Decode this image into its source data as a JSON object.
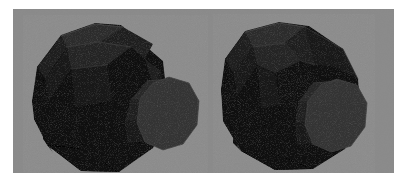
{
  "figure": {
    "title": "Two shaded stepped decagonal prisms",
    "background_color": "#8a8a8a",
    "page_color": "#ffffff",
    "plate": {
      "x": 13,
      "y": 9,
      "width": 381,
      "height": 164
    },
    "render_style": "flat-shaded faceted polyhedra",
    "object_count": 2
  },
  "palette": {
    "background": "#8a8a8a",
    "page": "#ffffff",
    "body_dark": "#141414",
    "body_darkest": "#070707",
    "body_mid": "#1d1d1d",
    "body_top": "#262626",
    "body_top_light": "#2b2b2b",
    "collar_shadow": "#0a0a0a",
    "end_cap": "#333333",
    "end_cap_dim": "#2c2c2c",
    "edge_highlight": "#4a4a4a",
    "edge_faint": "#3a3a3a"
  },
  "objects": [
    {
      "name": "left-polyhedron",
      "label": "Left stepped decagonal prism",
      "hub_facet_count": 10,
      "shaft_facet_count": 10,
      "end_cap_shape": "decagon",
      "end_cap_color": "#333333",
      "orientation_note": "viewed from upper-left, shaft pointing lower-right",
      "silhouette": "19,92 24,58 48,26 82,14 108,16 150,52 155,96 140,139 106,163 68,162 34,136 21,110",
      "hub": {
        "top_facets": [
          {
            "name": "hub-top-far",
            "points": "48,27 82,15 110,18 86,33 54,38",
            "fill": "#2b2b2b"
          },
          {
            "name": "hub-top-near",
            "points": "54,38 86,33 118,38 94,56 58,60",
            "fill": "#242424"
          },
          {
            "name": "hub-top-right",
            "points": "86,33 110,18 140,35 132,50 118,38",
            "fill": "#1f1f1f"
          }
        ],
        "side_facets": [
          {
            "name": "hub-side-upper-left",
            "points": "24,58 48,27 54,38 32,70",
            "fill": "#1a1a1a"
          },
          {
            "name": "hub-side-left",
            "points": "32,70 54,38 58,60 36,92",
            "fill": "#141414"
          },
          {
            "name": "hub-side-lower-left",
            "points": "19,92 32,70 36,92 24,116",
            "fill": "#101010"
          },
          {
            "name": "hub-front-upper",
            "points": "58,60 94,56 100,92 62,98",
            "fill": "#131313"
          },
          {
            "name": "hub-front-lower",
            "points": "36,92 62,98 70,140 30,130",
            "fill": "#0c0c0c"
          },
          {
            "name": "hub-bottom-left",
            "points": "21,110 36,92 30,130 40,144",
            "fill": "#090909"
          },
          {
            "name": "hub-bottom",
            "points": "34,136 70,140 106,163 68,162",
            "fill": "#070707"
          },
          {
            "name": "hub-bottom-right",
            "points": "70,140 100,92 140,110 106,163",
            "fill": "#0a0a0a"
          }
        ],
        "right_facets": [
          {
            "name": "hub-collar-right-upper",
            "points": "118,38 132,50 148,62 140,76 128,56",
            "fill": "#1c1c1c"
          },
          {
            "name": "hub-collar-right",
            "points": "140,76 148,62 155,96 143,120",
            "fill": "#161616"
          },
          {
            "name": "hub-collar-right-lower",
            "points": "143,120 155,96 140,139 120,150",
            "fill": "#101010"
          }
        ]
      },
      "collar": {
        "name": "hub-collar-band",
        "description": "recessed dark band between hub and shaft",
        "points": "94,56 118,38 132,50 140,76 136,112 118,140 100,150 86,124 100,92",
        "fill": "#0a0a0a"
      },
      "shaft": {
        "facets": [
          {
            "name": "shaft-top-far",
            "points": "118,90 134,72 158,70 146,88",
            "fill": "#262626"
          },
          {
            "name": "shaft-top-near",
            "points": "112,112 118,90 146,88 142,110",
            "fill": "#1e1e1e"
          },
          {
            "name": "shaft-side",
            "points": "112,112 142,110 140,132 114,134",
            "fill": "#161616"
          }
        ]
      },
      "end_cap": {
        "name": "left-end-cap",
        "points": "156,68 176,74 186,92 184,116 170,135 150,141 132,133 124,114 127,90 140,74",
        "fill": "#333333",
        "stroke": "#3e3e3e"
      }
    },
    {
      "name": "right-polyhedron",
      "label": "Right stepped decagonal prism",
      "hub_facet_count": 10,
      "shaft_facet_count": 10,
      "end_cap_shape": "decagon",
      "end_cap_color": "#333333",
      "orientation_note": "viewed from upper-left, rotated; upper-right chamfer exposed",
      "silhouette": "208,80 212,50 232,22 266,13 296,17 330,40 345,70 348,104 332,140 300,160 262,161 228,142 210,112",
      "hub": {
        "top_facets": [
          {
            "name": "r-hub-top-far",
            "points": "232,23 266,14 292,18 272,34 240,38",
            "fill": "#2b2b2b"
          },
          {
            "name": "r-hub-top-near",
            "points": "240,38 272,34 288,52 262,64 244,56",
            "fill": "#232323"
          },
          {
            "name": "r-hub-chamfer-right",
            "points": "272,34 292,18 330,40 302,56 288,52",
            "fill": "#1d1d1d"
          },
          {
            "name": "r-hub-chamfer-far",
            "points": "292,18 330,40 345,70 322,58 302,56",
            "fill": "#151515"
          }
        ],
        "side_facets": [
          {
            "name": "r-hub-side-upper-left",
            "points": "212,50 232,23 240,38 220,64",
            "fill": "#1b1b1b"
          },
          {
            "name": "r-hub-side-left",
            "points": "220,64 240,38 244,56 224,88",
            "fill": "#151515"
          },
          {
            "name": "r-hub-side-lower-left",
            "points": "208,80 220,64 224,88 212,112",
            "fill": "#101010"
          },
          {
            "name": "r-hub-front-upper",
            "points": "244,56 262,64 268,96 248,100",
            "fill": "#121212"
          },
          {
            "name": "r-hub-front-lower",
            "points": "224,88 248,100 256,142 220,134",
            "fill": "#0c0c0c"
          },
          {
            "name": "r-hub-bottom-left",
            "points": "210,112 224,88 220,134 228,142",
            "fill": "#090909"
          },
          {
            "name": "r-hub-bottom",
            "points": "228,142 256,142 300,160 262,161",
            "fill": "#070707"
          },
          {
            "name": "r-hub-bottom-right",
            "points": "256,142 268,96 312,114 300,160",
            "fill": "#0a0a0a"
          },
          {
            "name": "r-hub-right",
            "points": "288,52 302,56 322,58 330,92 312,114 268,96 262,64",
            "fill": "#111111"
          }
        ]
      },
      "collar": {
        "name": "r-hub-collar-band",
        "description": "recessed dark band along upper-right chamfer",
        "points": "288,52 302,56 322,58 345,70 340,86 316,74 300,66 288,60",
        "fill": "#0b0b0b"
      },
      "shaft": {
        "facets": [
          {
            "name": "r-shaft-top-far",
            "points": "286,92 300,74 326,72 314,90",
            "fill": "#272727"
          },
          {
            "name": "r-shaft-top-near",
            "points": "282,114 286,92 314,90 310,112",
            "fill": "#1f1f1f"
          },
          {
            "name": "r-shaft-side",
            "points": "282,114 310,112 308,134 284,136",
            "fill": "#171717"
          }
        ]
      },
      "end_cap": {
        "name": "right-end-cap",
        "points": "324,70 344,76 354,94 352,118 338,137 318,143 300,135 292,116 295,92 308,76",
        "fill": "#333333",
        "stroke": "#3e3e3e"
      }
    }
  ],
  "edge_highlights": [
    {
      "name": "left-hub-top-edge-1",
      "points": "48,27 82,15 110,18",
      "stroke": "#4f4f4f",
      "width": 0.9
    },
    {
      "name": "left-hub-top-edge-2",
      "points": "54,38 86,33 118,38",
      "stroke": "#454545",
      "width": 0.8
    },
    {
      "name": "left-hub-top-edge-3",
      "points": "58,60 94,56",
      "stroke": "#3c3c3c",
      "width": 0.8
    },
    {
      "name": "left-hub-top-ridge",
      "points": "86,33 110,18",
      "stroke": "#3a3a3a",
      "width": 0.7
    },
    {
      "name": "left-shaft-edge-1",
      "points": "134,72 158,70",
      "stroke": "#3e3e3e",
      "width": 0.8
    },
    {
      "name": "left-shaft-edge-2",
      "points": "118,90 146,88",
      "stroke": "#363636",
      "width": 0.7
    },
    {
      "name": "right-hub-top-edge-1",
      "points": "232,23 266,14 292,18",
      "stroke": "#4f4f4f",
      "width": 0.9
    },
    {
      "name": "right-hub-top-edge-2",
      "points": "240,38 272,34",
      "stroke": "#454545",
      "width": 0.8
    },
    {
      "name": "right-hub-chamfer-edge",
      "points": "292,18 330,40 345,70",
      "stroke": "#3d3d3d",
      "width": 0.8
    },
    {
      "name": "right-hub-top-ridge",
      "points": "272,34 288,52 302,56",
      "stroke": "#383838",
      "width": 0.7
    },
    {
      "name": "right-shaft-edge-1",
      "points": "300,74 326,72",
      "stroke": "#3e3e3e",
      "width": 0.8
    },
    {
      "name": "right-shaft-edge-2",
      "points": "286,92 314,90",
      "stroke": "#363636",
      "width": 0.7
    }
  ]
}
